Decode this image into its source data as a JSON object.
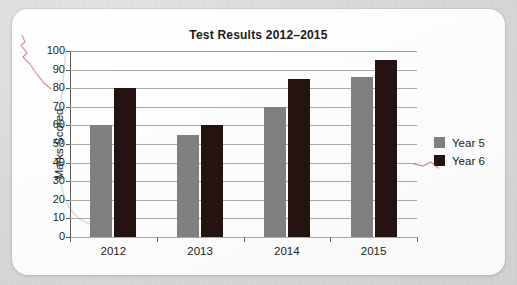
{
  "chart_data": {
    "type": "bar",
    "title": "Test Results 2012–2015",
    "xlabel": "",
    "ylabel": "Marks Scored",
    "categories": [
      "2012",
      "2013",
      "2014",
      "2015"
    ],
    "series": [
      {
        "name": "Year 5",
        "color": "#7f7f7f",
        "values": [
          60,
          55,
          70,
          86
        ]
      },
      {
        "name": "Year 6",
        "color": "#241310",
        "values": [
          80,
          60,
          85,
          95
        ]
      }
    ],
    "ylim": [
      0,
      100
    ],
    "ytick_labels": [
      "100",
      "90",
      "80",
      "70",
      "60",
      "50",
      "40",
      "30",
      "20",
      "10",
      "0"
    ],
    "ytick_values": [
      100,
      90,
      80,
      70,
      60,
      50,
      40,
      30,
      20,
      10,
      0
    ],
    "ystep": 10,
    "grid": true,
    "legend_position": "right"
  },
  "colors": {
    "year5": "#7f7f7f",
    "year6": "#241310",
    "gridline": "#a9a9a9",
    "axis": "#5a5a5a",
    "text": "#1c1c1c",
    "card": "#fdfdfd",
    "page_background": "#d8d8d6",
    "pencil_mark": "#c4404a"
  }
}
